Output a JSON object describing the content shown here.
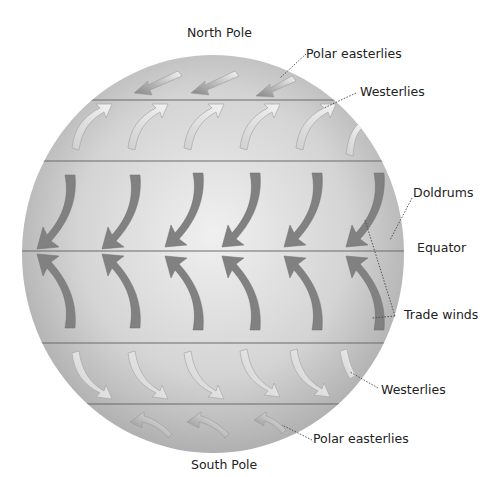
{
  "diagram": {
    "labels": {
      "north_pole": "North Pole",
      "south_pole": "South Pole",
      "polar_easterlies_north": "Polar easterlies",
      "westerlies_north": "Westerlies",
      "doldrums": "Doldrums",
      "equator": "Equator",
      "trade_winds": "Trade winds",
      "westerlies_south": "Westerlies",
      "polar_easterlies_south": "Polar easterlies"
    },
    "colors": {
      "globe_light": "#ececec",
      "globe_dark": "#b4b4b4",
      "latitude_line": "#6a6a6a",
      "polar_arrow": "#8c8c8c",
      "westerly_arrow": "#e2e2e2",
      "trade_arrow": "#7f7f7f",
      "leader_line": "#444444"
    },
    "belts": [
      {
        "name": "Polar easterlies (N)",
        "direction": "down-left",
        "arrow_count": 3
      },
      {
        "name": "Westerlies (N)",
        "direction": "up-right",
        "arrow_count": 5
      },
      {
        "name": "Trade winds (N)",
        "direction": "down-left",
        "arrow_count": 6
      },
      {
        "name": "Trade winds (S)",
        "direction": "up-left",
        "arrow_count": 6
      },
      {
        "name": "Westerlies (S)",
        "direction": "down-right",
        "arrow_count": 6
      },
      {
        "name": "Polar easterlies (S)",
        "direction": "up-left",
        "arrow_count": 3
      }
    ]
  }
}
